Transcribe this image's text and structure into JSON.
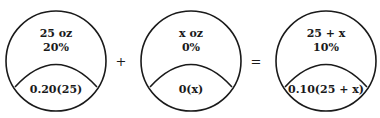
{
  "diagram": {
    "containers": [
      {
        "amount": "25 oz",
        "percent": "20%",
        "expression": "0.20(25)"
      },
      {
        "amount": "x oz",
        "percent": "0%",
        "expression": "0(x)"
      },
      {
        "amount": "25 + x",
        "percent": "10%",
        "expression": "0.10(25 + x)"
      }
    ],
    "operators": [
      "+",
      "="
    ]
  }
}
